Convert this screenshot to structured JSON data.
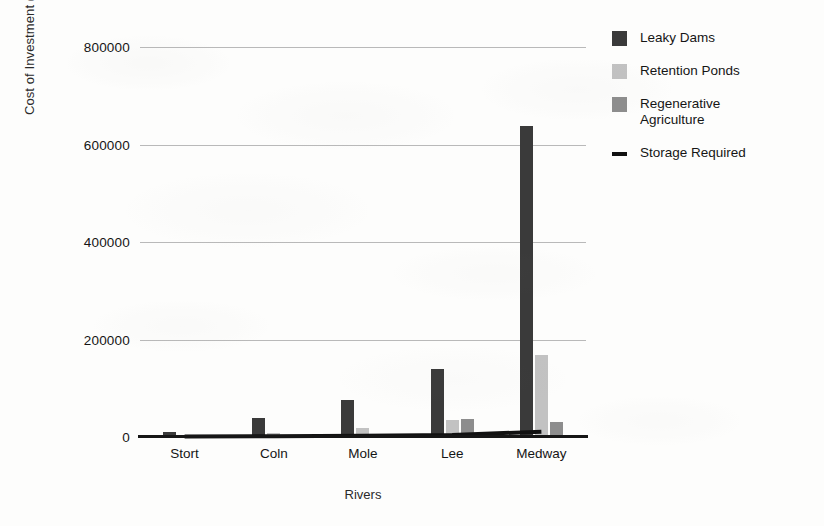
{
  "chart_data": {
    "type": "bar",
    "title": "",
    "xlabel": "Rivers",
    "ylabel": "Cost of Investment (£)",
    "categories": [
      "Stort",
      "Coln",
      "Mole",
      "Lee",
      "Medway"
    ],
    "ylim": [
      0,
      800000
    ],
    "ytick_labels": [
      "0",
      "200000",
      "400000",
      "600000",
      "800000"
    ],
    "ytick_values": [
      0,
      200000,
      400000,
      600000,
      800000
    ],
    "grid": true,
    "legend_position": "right",
    "series": [
      {
        "name": "Leaky Dams",
        "type": "bar",
        "color": "#3a3a3a",
        "values": [
          10000,
          40000,
          75000,
          140000,
          637000
        ]
      },
      {
        "name": "Retention Ponds",
        "type": "bar",
        "color": "#c2c2c2",
        "values": [
          2000,
          8000,
          18000,
          35000,
          168000
        ]
      },
      {
        "name": "Regenerative Agriculture",
        "type": "bar",
        "color": "#8d8d8d",
        "values": [
          0,
          0,
          0,
          36000,
          30000
        ]
      },
      {
        "name": "Storage Required",
        "type": "line",
        "color": "#111111",
        "values": [
          1000,
          1500,
          2500,
          4000,
          11000
        ]
      }
    ]
  },
  "legend": {
    "items": [
      {
        "label": "Leaky Dams",
        "swatch": "square-dark"
      },
      {
        "label": "Retention Ponds",
        "swatch": "square-light"
      },
      {
        "label": "Regenerative\nAgriculture",
        "swatch": "square-medium"
      },
      {
        "label": "Storage Required",
        "swatch": "line-black"
      }
    ]
  },
  "axes": {
    "y_title": "Cost of Investment (£)",
    "x_title": "Rivers"
  }
}
